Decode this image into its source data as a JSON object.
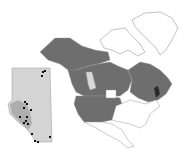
{
  "map": {
    "title": "North America distribution map with Alberta inset",
    "colors": {
      "background": "#ffffff",
      "occupied_region": "#6e6e6e",
      "unoccupied_region": "#ffffff",
      "alberta_highlight": "#d8d8d8",
      "outline": "#9a9a9a",
      "dark_region": "#2a2a2a",
      "inset_fill_light": "#d4d4d4",
      "inset_fill_dark": "#9e9e9e",
      "inset_points": "#111111"
    },
    "inset": {
      "name": "Alberta inset",
      "points": [
        [
          43,
          72
        ],
        [
          45,
          71
        ],
        [
          42,
          76
        ],
        [
          25,
          102
        ],
        [
          27,
          104
        ],
        [
          24,
          108
        ],
        [
          31,
          110
        ],
        [
          20,
          117
        ],
        [
          27,
          117
        ],
        [
          26,
          121
        ],
        [
          24,
          123
        ],
        [
          28,
          124
        ],
        [
          32,
          134
        ],
        [
          50,
          137
        ],
        [
          35,
          141
        ],
        [
          38,
          142
        ]
      ]
    }
  }
}
